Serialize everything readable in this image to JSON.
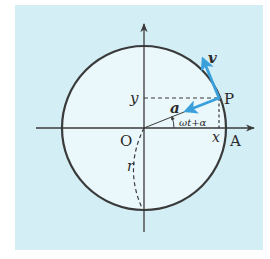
{
  "diagram": {
    "type": "uniform circular motion on unit circle",
    "colors": {
      "panel": "#d4eef5",
      "circle_fill": "#eaf7fb",
      "stroke": "#3a3a3a",
      "vector": "#3aa0dc"
    },
    "labels": {
      "origin": "O",
      "point_p": "P",
      "point_a": "A",
      "y_coord": "y",
      "x_coord": "x",
      "velocity": "v",
      "acceleration": "a",
      "angle": "ωt+α",
      "radius": "r"
    },
    "elements": [
      {
        "id": "x-axis",
        "kind": "axis",
        "direction": "horizontal",
        "arrow": true
      },
      {
        "id": "y-axis",
        "kind": "axis",
        "direction": "vertical",
        "arrow": true
      },
      {
        "id": "circle",
        "kind": "circle",
        "center": "O",
        "radius_label": "r"
      },
      {
        "id": "radius-op",
        "kind": "segment",
        "from": "O",
        "to": "P"
      },
      {
        "id": "velocity-vector",
        "kind": "vector",
        "from": "P",
        "direction": "tangent",
        "label": "v"
      },
      {
        "id": "acceleration-vector",
        "kind": "vector",
        "from": "P",
        "direction": "toward center",
        "label": "a"
      },
      {
        "id": "y-projection",
        "kind": "dashed-segment",
        "from": "P",
        "to": "y-axis"
      },
      {
        "id": "x-projection",
        "kind": "dashed-segment",
        "from": "P",
        "to": "x-axis"
      },
      {
        "id": "angle-arc",
        "kind": "arc",
        "label": "ωt+α"
      },
      {
        "id": "radius-arc",
        "kind": "dashed-arc",
        "label": "r"
      }
    ]
  }
}
